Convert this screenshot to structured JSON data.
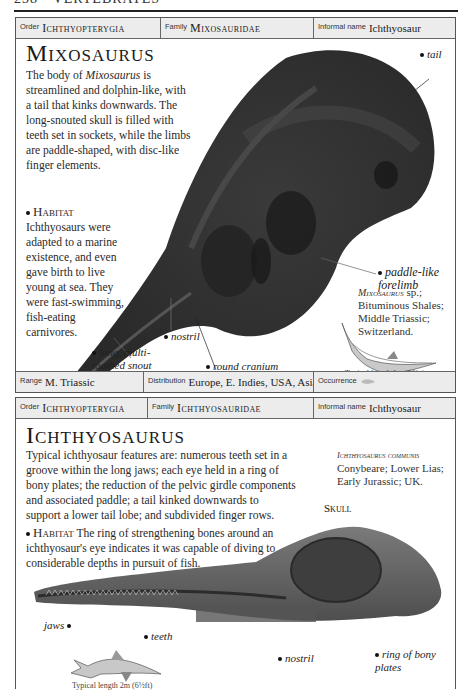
{
  "running_head": "238 • VERTEBRATES",
  "entries": [
    {
      "order_label": "Order",
      "order_value": "Ichthyopterygia",
      "family_label": "Family",
      "family_value": "Mixosauridae",
      "informal_label": "Informal name",
      "informal_value": "Ichthyosaur",
      "title": "Mixosaurus",
      "body_pre": "The body of ",
      "body_italic": "Mixosaurus",
      "body_post": " is streamlined and dolphin-like, with a tail that kinks downwards. The long-snouted skull is filled with teeth set in sockets, while the limbs are paddle-shaped, with disc-like finger elements.",
      "habitat_label": "Habitat",
      "habitat_text": "Ichthyosaurs were adapted to a marine existence, and even gave birth to live young at sea. They were fast-swimming, fish-eating carnivores.",
      "callouts": {
        "tail": "tail",
        "paddle": "paddle-like forelimb",
        "nostril": "nostril",
        "snout": "long, multi-toothed snout",
        "cranium": "round cranium with large eye"
      },
      "specimen_name": "Mixosaurus",
      "specimen_suffix": "sp.;",
      "specimen_lines": [
        "Bituminous Shales;",
        "Middle Triassic;",
        "Switzerland."
      ],
      "typical_length": "Typical length 1m (39in)",
      "range_label": "Range",
      "range_value": "M. Triassic",
      "distribution_label": "Distribution",
      "distribution_value": "Europe, E. Indies, USA, Asia",
      "occurrence_label": "Occurrence",
      "occurrence_icon": "fish-icon"
    },
    {
      "order_label": "Order",
      "order_value": "Ichthyopterygia",
      "family_label": "Family",
      "family_value": "Ichthyosauridae",
      "informal_label": "Informal name",
      "informal_value": "Ichthyosaur",
      "title": "Ichthyosaurus",
      "body": "Typical ichthyosaur features are: numerous teeth set in a groove within the long jaws; each eye held in a ring of bony plates; the reduction of the pelvic girdle components and associated paddle; a tail kinked downwards to support a lower tail lobe; and subdivided finger rows.",
      "habitat_label": "Habitat",
      "habitat_text": "The ring of strengthening bones around an ichthyosaur's eye indicates it was capable of diving to considerable depths in pursuit of fish.",
      "specimen_name": "Ichthyosaurus communis",
      "specimen_lines": [
        "Conybeare; Lower Lias;",
        "Early Jurassic; UK."
      ],
      "skull_label": "Skull",
      "callouts": {
        "jaws": "jaws",
        "teeth": "teeth",
        "nostril": "nostril",
        "ring": "ring of bony plates"
      },
      "typical_length": "Typical length 2m (6½ft)"
    }
  ]
}
